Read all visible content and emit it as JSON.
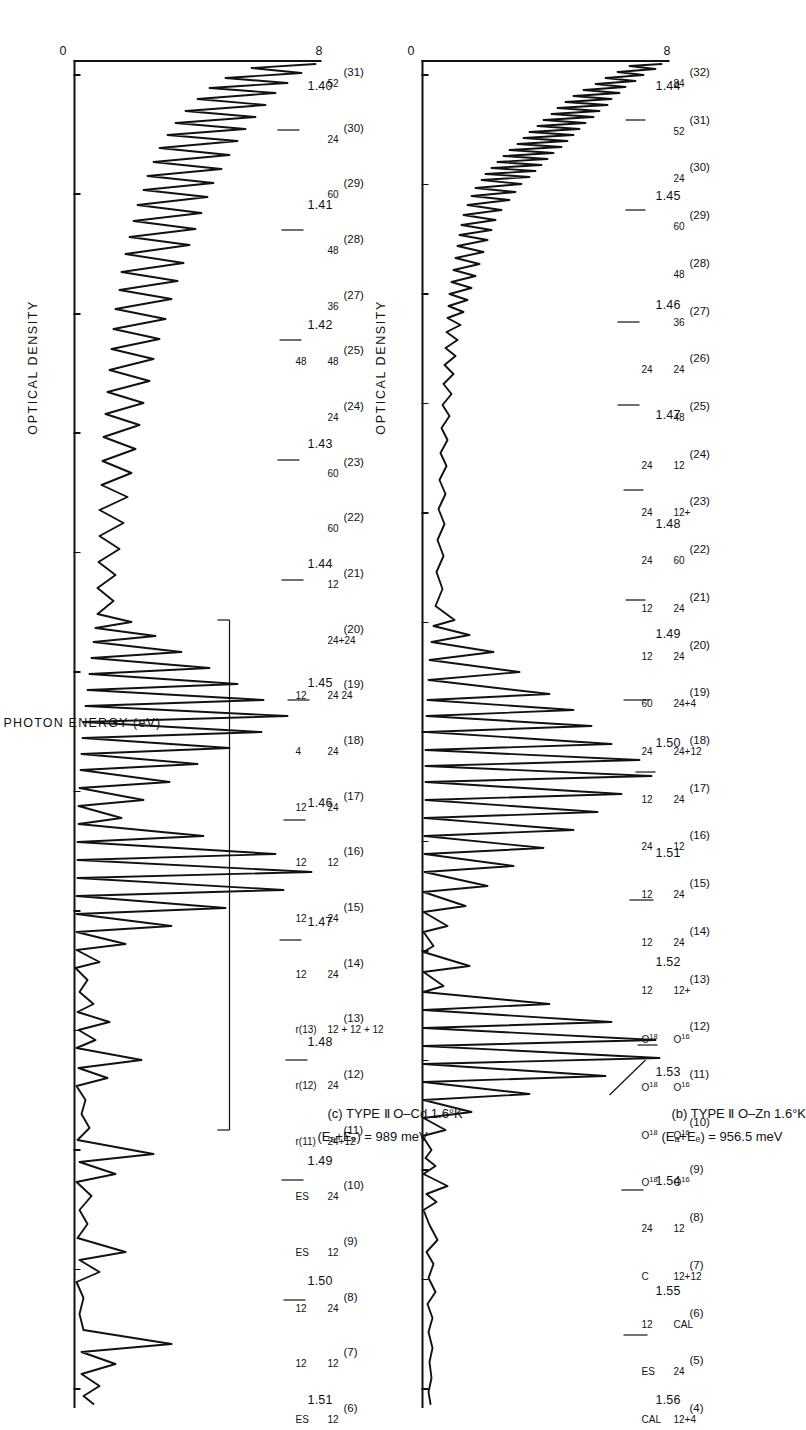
{
  "figure": {
    "orientation": "rotated-90-cw",
    "y_axis_label": "OPTICAL DENSITY",
    "x_axis_label": "PHOTON ENERGY  (eV)",
    "y_top_label": "8",
    "y_bottom_label": "0",
    "ink_color": "#111111",
    "background": "#ffffff"
  },
  "panels": [
    {
      "id": "b",
      "tag": "(b)",
      "title": "(b) TYPE Ⅱ  O–Zn 1.6°K",
      "subtitle_prefix": "(E",
      "subtitle": "(Eₐ+Eₑ) = 956.5 meV",
      "sub_A": "A",
      "sub_D": "D",
      "sub_value": ") = 956.5 meV",
      "sample": "O–Zn",
      "temperature": "1.6°K",
      "type": "TYPE Ⅱ",
      "energy_sum": "956.5 meV",
      "x_ticks": [
        "1.44",
        "1.45",
        "1.46",
        "1.47",
        "1.48",
        "1.49",
        "1.50",
        "1.51",
        "1.52",
        "1.53",
        "1.54",
        "1.55",
        "1.56"
      ],
      "x_range": [
        1.435,
        1.566
      ],
      "y_range": [
        0,
        8
      ],
      "peak_labels": [
        {
          "paren": "(4)",
          "note": "12+4",
          "sub": "CAL"
        },
        {
          "paren": "(5)",
          "note": "24",
          "sub": "ES"
        },
        {
          "paren": "(6)",
          "note": "CAL",
          "sub": "12"
        },
        {
          "paren": "(7)",
          "note": "12+12",
          "sub": "C"
        },
        {
          "paren": "(8)",
          "note": "12",
          "sub": "24"
        },
        {
          "paren": "(9)",
          "note": "O16",
          "sub": "O18"
        },
        {
          "paren": "(10)",
          "note": "O16",
          "sub": "O18"
        },
        {
          "paren": "(11)",
          "note": "O16",
          "sub": "O18"
        },
        {
          "paren": "(12)",
          "note": "O16",
          "sub": "O18"
        },
        {
          "paren": "(13)",
          "note": "12+",
          "sub": "12"
        },
        {
          "paren": "(14)",
          "note": "24",
          "sub": "12"
        },
        {
          "paren": "(15)",
          "note": "24",
          "sub": "12"
        },
        {
          "paren": "(16)",
          "note": "12",
          "sub": "24"
        },
        {
          "paren": "(17)",
          "note": "24",
          "sub": "12"
        },
        {
          "paren": "(18)",
          "note": "24+12",
          "sub": "24"
        },
        {
          "paren": "(19)",
          "note": "24+4",
          "sub": "60"
        },
        {
          "paren": "(20)",
          "note": "24",
          "sub": "12"
        },
        {
          "paren": "(21)",
          "note": "24",
          "sub": "12"
        },
        {
          "paren": "(22)",
          "note": "60",
          "sub": "24"
        },
        {
          "paren": "(23)",
          "note": "12+",
          "sub": "24"
        },
        {
          "paren": "(24)",
          "note": "12",
          "sub": "24"
        },
        {
          "paren": "(25)",
          "note": "48",
          "sub": ""
        },
        {
          "paren": "(26)",
          "note": "24",
          "sub": "24"
        },
        {
          "paren": "(27)",
          "note": "36",
          "sub": ""
        },
        {
          "paren": "(28)",
          "note": "48",
          "sub": ""
        },
        {
          "paren": "(29)",
          "note": "60",
          "sub": ""
        },
        {
          "paren": "(30)",
          "note": "24",
          "sub": ""
        },
        {
          "paren": "(31)",
          "note": "52",
          "sub": ""
        },
        {
          "paren": "(32)",
          "note": "84",
          "sub": ""
        }
      ]
    },
    {
      "id": "c",
      "tag": "(c)",
      "title": "(c) TYPE Ⅱ  O–Cd 1.6°K",
      "subtitle": "(Eₐ+Eₑ) = 989 meV",
      "sub_A": "A",
      "sub_D": "D",
      "sub_value": ") = 989 meV",
      "sample": "O–Cd",
      "temperature": "1.6°K",
      "type": "TYPE Ⅱ",
      "energy_sum": "989 meV",
      "x_ticks": [
        "1.40",
        "1.41",
        "1.42",
        "1.43",
        "1.44",
        "1.45",
        "1.46",
        "1.47",
        "1.48",
        "1.49",
        "1.50",
        "1.51"
      ],
      "x_range": [
        1.392,
        1.513
      ],
      "y_range": [
        0,
        8
      ],
      "peak_labels": [
        {
          "paren": "(6)",
          "note": "12",
          "sub": "ES"
        },
        {
          "paren": "(7)",
          "note": "12",
          "sub": "12"
        },
        {
          "paren": "(8)",
          "note": "24",
          "sub": "12"
        },
        {
          "paren": "(9)",
          "note": "12",
          "sub": "ES"
        },
        {
          "paren": "(10)",
          "note": "24",
          "sub": "ES"
        },
        {
          "paren": "(11)",
          "note": "24+12",
          "sub": "r(11)"
        },
        {
          "paren": "(12)",
          "note": "24",
          "sub": "r(12)"
        },
        {
          "paren": "(13)",
          "note": "12 + 12 + 12",
          "sub": "r(13)"
        },
        {
          "paren": "(14)",
          "note": "24",
          "sub": "12"
        },
        {
          "paren": "(15)",
          "note": "24",
          "sub": "12"
        },
        {
          "paren": "(16)",
          "note": "12",
          "sub": "12"
        },
        {
          "paren": "(17)",
          "note": "24",
          "sub": "12"
        },
        {
          "paren": "(18)",
          "note": "24",
          "sub": "4"
        },
        {
          "paren": "(19)",
          "note": "24 24",
          "sub": "12"
        },
        {
          "paren": "(20)",
          "note": "24+24",
          "sub": ""
        },
        {
          "paren": "(21)",
          "note": "12",
          "sub": ""
        },
        {
          "paren": "(22)",
          "note": "60",
          "sub": ""
        },
        {
          "paren": "(23)",
          "note": "60",
          "sub": ""
        },
        {
          "paren": "(24)",
          "note": "24",
          "sub": ""
        },
        {
          "paren": "(25)",
          "note": "48",
          "sub": "48"
        },
        {
          "paren": "(27)",
          "note": "36",
          "sub": ""
        },
        {
          "paren": "(28)",
          "note": "48",
          "sub": ""
        },
        {
          "paren": "(29)",
          "note": "60",
          "sub": ""
        },
        {
          "paren": "(30)",
          "note": "24",
          "sub": ""
        },
        {
          "paren": "(31)",
          "note": "52",
          "sub": ""
        }
      ],
      "inset_labels": [
        "1.44",
        "1.45",
        "1.46"
      ],
      "misc_labels": [
        "O16",
        "O18",
        "ES",
        "?",
        "4"
      ]
    }
  ],
  "chart_data": {
    "type": "line",
    "xlabel": "PHOTON ENERGY  (eV)",
    "ylabel": "OPTICAL DENSITY",
    "grid": false,
    "legend": "none",
    "series": [
      {
        "name": "(b) TYPE II O–Zn 1.6°K",
        "xlim": [
          1.435,
          1.566
        ],
        "ylim": [
          0,
          8
        ],
        "xtick_labels": [
          "1.44",
          "1.45",
          "1.46",
          "1.47",
          "1.48",
          "1.49",
          "1.50",
          "1.51",
          "1.52",
          "1.53",
          "1.54",
          "1.55",
          "1.56"
        ],
        "annotations": [
          {
            "index": "(4)",
            "energy": 1.563,
            "assignment": "CAL / 12+4"
          },
          {
            "index": "(5)",
            "energy": 1.5415,
            "assignment": "24 / ES"
          },
          {
            "index": "(6)",
            "energy": 1.5285,
            "assignment": "CAL / 12 / C"
          },
          {
            "index": "(7)",
            "energy": 1.5195,
            "assignment": "12+12 / C"
          },
          {
            "index": "(8)",
            "energy": 1.5055,
            "assignment": "24 / 12"
          },
          {
            "index": "(9)",
            "energy": 1.5005,
            "assignment": "12 / C / CAL"
          },
          {
            "index": "(10)",
            "energy": 1.4915,
            "assignment": "24 / 24+4"
          },
          {
            "index": "(11)",
            "energy": 1.487,
            "assignment": "24 / 12 / C"
          },
          {
            "index": "(12)",
            "energy": 1.48,
            "assignment": "24"
          },
          {
            "index": "(13)",
            "energy": 1.4755,
            "assignment": "12+ / 12+ / 12"
          },
          {
            "index": "(14)",
            "energy": 1.472,
            "assignment": "24 / 12"
          },
          {
            "index": "(15)",
            "energy": 1.469,
            "assignment": "24 / 12"
          },
          {
            "index": "(16)",
            "energy": 1.4655,
            "assignment": "12 / 24 / ?"
          },
          {
            "index": "(17)",
            "energy": 1.462,
            "assignment": "24 / 12"
          },
          {
            "index": "(18)",
            "energy": 1.4595,
            "assignment": "24+12 / 24"
          },
          {
            "index": "(19)",
            "energy": 1.456,
            "assignment": "24+4 / 60"
          },
          {
            "index": "(20)",
            "energy": 1.454,
            "assignment": "24 / 12"
          },
          {
            "index": "(21)",
            "energy": 1.451,
            "assignment": "24 / 12"
          },
          {
            "index": "(22)",
            "energy": 1.449,
            "assignment": "60 / 24"
          },
          {
            "index": "(23)",
            "energy": 1.447,
            "assignment": "12+ / 24"
          },
          {
            "index": "(24)",
            "energy": 1.4455,
            "assignment": "12 / 24"
          },
          {
            "index": "(25)",
            "energy": 1.444,
            "assignment": "48"
          },
          {
            "index": "(26)",
            "energy": 1.4425,
            "assignment": "24 / 24"
          },
          {
            "index": "(27)",
            "energy": 1.441,
            "assignment": "36"
          },
          {
            "index": "(28)",
            "energy": 1.44,
            "assignment": "48"
          },
          {
            "index": "(29)",
            "energy": 1.4385,
            "assignment": "60"
          },
          {
            "index": "(30)",
            "energy": 1.4375,
            "assignment": "24"
          },
          {
            "index": "(31)",
            "energy": 1.437,
            "assignment": "52"
          },
          {
            "index": "(32)",
            "energy": 1.436,
            "assignment": "84"
          }
        ],
        "isotope_labels": [
          "O¹⁶",
          "O¹⁸"
        ],
        "other_labels": [
          "CAL",
          "ES",
          "C",
          "?"
        ]
      },
      {
        "name": "(c) TYPE II O–Cd 1.6°K",
        "xlim": [
          1.392,
          1.513
        ],
        "ylim": [
          0,
          8
        ],
        "xtick_labels": [
          "1.40",
          "1.41",
          "1.42",
          "1.43",
          "1.44",
          "1.45",
          "1.46",
          "1.47",
          "1.48",
          "1.49",
          "1.50",
          "1.51"
        ],
        "annotations": [
          {
            "index": "(6)",
            "energy": 1.5005,
            "assignment": "12 / ES"
          },
          {
            "index": "(7)",
            "energy": 1.48,
            "assignment": "12 / 12"
          },
          {
            "index": "(8)",
            "energy": 1.4715,
            "assignment": "24 / 12 / ES"
          },
          {
            "index": "(9)",
            "energy": 1.465,
            "assignment": "12 / ?"
          },
          {
            "index": "(10)",
            "energy": 1.4585,
            "assignment": "24 / ES / 4"
          },
          {
            "index": "(11)",
            "energy": 1.4535,
            "assignment": "24+12 / r(11)"
          },
          {
            "index": "(12)",
            "energy": 1.4495,
            "assignment": "24 / r(12)"
          },
          {
            "index": "(13)",
            "energy": 1.4455,
            "assignment": "12 + 12 + 12 / r(13)"
          },
          {
            "index": "(14)",
            "energy": 1.4405,
            "assignment": "24 / 12"
          },
          {
            "index": "(15)",
            "energy": 1.435,
            "assignment": "24 / 12"
          },
          {
            "index": "(16)",
            "energy": 1.432,
            "assignment": "12 / 12"
          },
          {
            "index": "(17)",
            "energy": 1.4295,
            "assignment": "24 / 24 / 12"
          },
          {
            "index": "(18)",
            "energy": 1.427,
            "assignment": "24 / 4"
          },
          {
            "index": "(19)",
            "energy": 1.425,
            "assignment": "24 24 / 12"
          },
          {
            "index": "(20)",
            "energy": 1.4225,
            "assignment": "24+24"
          },
          {
            "index": "(21)",
            "energy": 1.42,
            "assignment": "12"
          },
          {
            "index": "(22)",
            "energy": 1.4185,
            "assignment": "60"
          },
          {
            "index": "(23)",
            "energy": 1.4165,
            "assignment": "60"
          },
          {
            "index": "(24)",
            "energy": 1.415,
            "assignment": "24"
          },
          {
            "index": "(25)",
            "energy": 1.413,
            "assignment": "48 / 48"
          },
          {
            "index": "(27)",
            "energy": 1.411,
            "assignment": "36"
          },
          {
            "index": "(28)",
            "energy": 1.4095,
            "assignment": "48"
          },
          {
            "index": "(29)",
            "energy": 1.4075,
            "assignment": "60"
          },
          {
            "index": "(30)",
            "energy": 1.4065,
            "assignment": "24"
          },
          {
            "index": "(31)",
            "energy": 1.4055,
            "assignment": "52"
          }
        ],
        "isotope_labels": [
          "O¹⁶",
          "O¹⁸"
        ],
        "other_labels": [
          "ES",
          "?",
          "4",
          "r(11)",
          "r(12)",
          "r(13)"
        ],
        "inset_tick_labels": [
          "1.44",
          "1.45",
          "1.46"
        ]
      }
    ]
  }
}
